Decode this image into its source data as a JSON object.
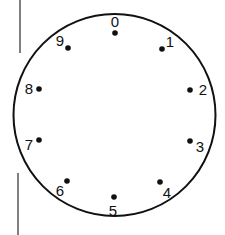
{
  "diagram": {
    "type": "dial",
    "colors": {
      "background": "#ffffff",
      "stroke": "#111111",
      "dot": "#111111",
      "side_line": "#555555"
    },
    "circle": {
      "cx": 114.5,
      "cy": 115,
      "r": 101
    },
    "positions": [
      {
        "label": "0",
        "dot": [
          115,
          33
        ],
        "text": [
          115,
          27
        ]
      },
      {
        "label": "1",
        "dot": [
          162,
          49
        ],
        "text": [
          170,
          47
        ]
      },
      {
        "label": "2",
        "dot": [
          190,
          90
        ],
        "text": [
          203,
          95
        ]
      },
      {
        "label": "3",
        "dot": [
          190,
          141
        ],
        "text": [
          200,
          152
        ]
      },
      {
        "label": "4",
        "dot": [
          160,
          182
        ],
        "text": [
          167,
          198
        ]
      },
      {
        "label": "5",
        "dot": [
          114,
          197
        ],
        "text": [
          113,
          216
        ]
      },
      {
        "label": "6",
        "dot": [
          67,
          181
        ],
        "text": [
          60,
          196
        ]
      },
      {
        "label": "7",
        "dot": [
          39,
          140
        ],
        "text": [
          29,
          150
        ]
      },
      {
        "label": "8",
        "dot": [
          39,
          89
        ],
        "text": [
          29,
          94
        ]
      },
      {
        "label": "9",
        "dot": [
          68,
          48
        ],
        "text": [
          60,
          46
        ]
      }
    ],
    "side_lines": [
      {
        "x": 20,
        "y1": 0,
        "y2": 53
      },
      {
        "x": 18,
        "y1": 173,
        "y2": 235
      }
    ]
  }
}
